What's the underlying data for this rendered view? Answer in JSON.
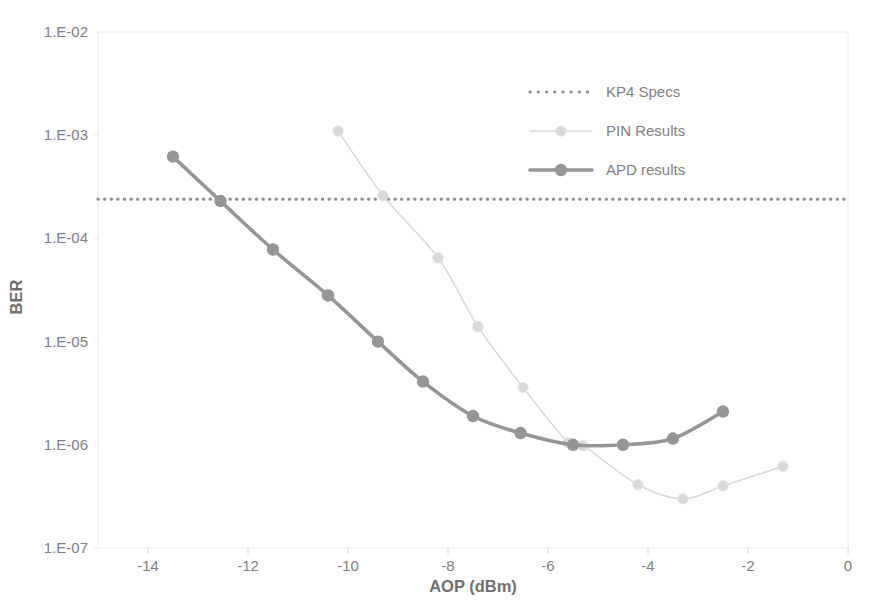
{
  "chart_data": {
    "type": "line",
    "title": "",
    "xlabel": "AOP (dBm)",
    "ylabel": "BER",
    "xlim": [
      -15,
      0
    ],
    "ylim": [
      1e-07,
      0.01
    ],
    "yscale": "log",
    "grid": false,
    "legend_position": "upper-right",
    "xticks": [
      -14,
      -12,
      -10,
      -8,
      -6,
      -4,
      -2,
      0
    ],
    "xtick_labels": [
      "-14",
      "-12",
      "-10",
      "-8",
      "-6",
      "-4",
      "-2",
      "0"
    ],
    "yticks": [
      0.01,
      0.001,
      0.0001,
      1e-05,
      1e-06,
      1e-07
    ],
    "ytick_labels": [
      "1.E-02",
      "1.E-03",
      "1.E-04",
      "1.E-05",
      "1.E-06",
      "1.E-07"
    ],
    "series": [
      {
        "name": "KP4 Specs",
        "style": "dotted",
        "color": "#8d8d8d",
        "marker": "none",
        "constant_y": 0.00024,
        "x": [
          -15,
          0
        ],
        "values": [
          0.00024,
          0.00024
        ]
      },
      {
        "name": "PIN Results",
        "style": "solid-light",
        "color": "#d9d9d9",
        "marker": "circle",
        "x": [
          -10.2,
          -9.3,
          -8.2,
          -7.4,
          -6.5,
          -5.6,
          -5.3,
          -4.2,
          -3.3,
          -2.5,
          -1.3
        ],
        "values": [
          0.0011,
          0.00026,
          6.5e-05,
          1.4e-05,
          3.6e-06,
          1.05e-06,
          9.8e-07,
          4.1e-07,
          3e-07,
          4e-07,
          6.2e-07
        ]
      },
      {
        "name": "APD results",
        "style": "solid-bold",
        "color": "#959595",
        "marker": "circle",
        "x": [
          -13.5,
          -12.55,
          -11.5,
          -10.4,
          -9.4,
          -8.5,
          -7.5,
          -6.55,
          -5.5,
          -4.5,
          -3.5,
          -2.5
        ],
        "values": [
          0.00062,
          0.00023,
          7.8e-05,
          2.8e-05,
          1e-05,
          4.1e-06,
          1.9e-06,
          1.3e-06,
          1e-06,
          1e-06,
          1.15e-06,
          2.1e-06
        ]
      }
    ]
  },
  "legend": {
    "items": [
      {
        "label": "KP4 Specs"
      },
      {
        "label": "PIN Results"
      },
      {
        "label": "APD results"
      }
    ]
  },
  "axes": {
    "x_title": "AOP (dBm)",
    "y_title": "BER"
  }
}
